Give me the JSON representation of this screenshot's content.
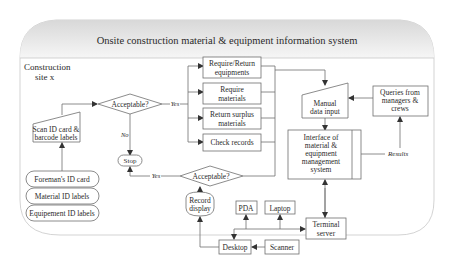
{
  "title": "Onsite construction material & equipment information system",
  "site_label": [
    "Construction",
    "site x"
  ],
  "nodes": {
    "scan": [
      "Scan ID card &",
      "barcode labels"
    ],
    "foreman_card": "Foreman's ID card",
    "material_labels": "Material ID labels",
    "equipment_labels": "Equipement ID labels",
    "acceptable_1": "Acceptable?",
    "acceptable_2": "Acceptable?",
    "stop": "Stop",
    "require_return_equipments": [
      "Require/Return",
      "equipments"
    ],
    "require_materials": [
      "Require",
      "materials"
    ],
    "return_surplus": [
      "Return surplus",
      "materials"
    ],
    "check_records": "Check records",
    "manual_input": [
      "Manual",
      "data input"
    ],
    "queries": [
      "Queries from",
      "managers &",
      "crews"
    ],
    "interface": [
      "Interface of",
      "material &",
      "equipment",
      "management",
      "system"
    ],
    "record_display": [
      "Record",
      "display"
    ],
    "pda": "PDA",
    "laptop": "Laptop",
    "terminal_server": [
      "Terminal",
      "server"
    ],
    "desktop": "Desktop",
    "scanner": "Scanner"
  },
  "edge_labels": {
    "yes_1": "Yes",
    "no": "No",
    "yes_2": "Yes",
    "results": "Results"
  },
  "colors": {
    "stroke": "#6e6e6e",
    "header_fill": "#e9e9e9",
    "text": "#2a2a2a"
  }
}
